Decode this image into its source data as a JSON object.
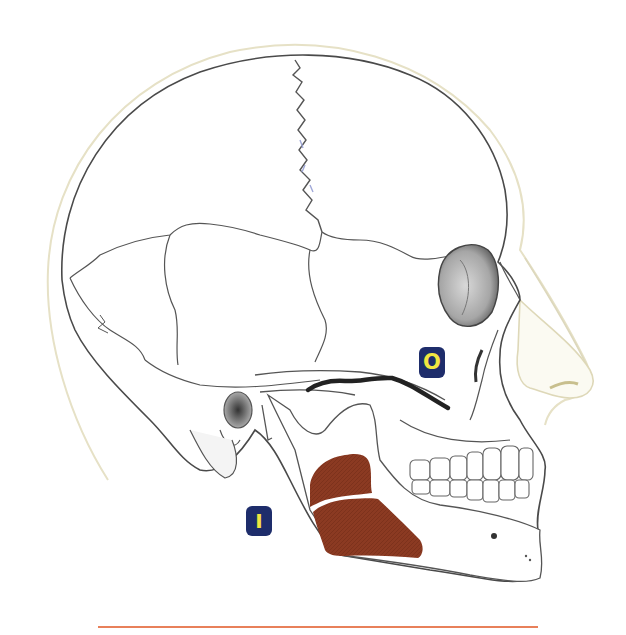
{
  "figure": {
    "muscle": {
      "name": "masseter",
      "color": "#8b3a22",
      "origin_line_color": "#222222"
    },
    "labels": {
      "origin": {
        "text": "O",
        "bg_color": "#1e2d6b",
        "fg_color": "#f2e641"
      },
      "insertion": {
        "text": "I",
        "bg_color": "#1e2d6b",
        "fg_color": "#f2e641"
      }
    },
    "divider": {
      "color": "#e8805a"
    },
    "colors": {
      "background": "#ffffff",
      "bone_line": "#555555",
      "soft_tissue_line": "#e4e0c8",
      "shading": "#9a9a9a"
    }
  }
}
